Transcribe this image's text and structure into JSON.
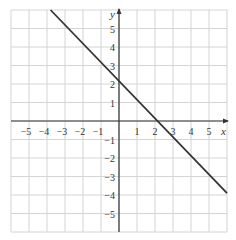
{
  "chart_data": {
    "type": "line",
    "title": "",
    "xlabel": "x",
    "ylabel": "y",
    "xlim": [
      -6,
      6
    ],
    "ylim": [
      -6,
      6
    ],
    "grid": true,
    "x_ticks": [
      -5,
      -4,
      -3,
      -2,
      -1,
      1,
      2,
      3,
      4,
      5
    ],
    "y_ticks": [
      5,
      4,
      3,
      2,
      1,
      -1,
      -2,
      -3,
      -4,
      -5
    ],
    "x_tick_labels": [
      "−5",
      "−4",
      "−3",
      "−2",
      "−1",
      "1",
      "2",
      "3",
      "4",
      "5"
    ],
    "y_tick_labels": [
      "5",
      "4",
      "3",
      "2",
      "1",
      "−1",
      "−2",
      "−3",
      "−4",
      "−5"
    ],
    "series": [
      {
        "name": "line",
        "points": [
          [
            -3.8,
            6
          ],
          [
            0,
            2.1
          ],
          [
            2.2,
            0
          ],
          [
            6,
            -3.9
          ]
        ],
        "color": "#333333"
      }
    ]
  },
  "axes": {
    "x_label": "x",
    "y_label": "y"
  }
}
